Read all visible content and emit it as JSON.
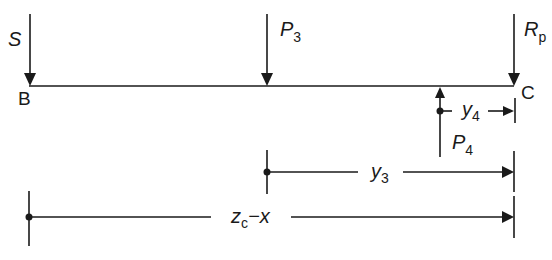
{
  "diagram": {
    "type": "beam-force-diagram",
    "stroke_color": "#1a1a1a",
    "background": "#ffffff",
    "nodes": [
      {
        "id": "B",
        "label": "B"
      },
      {
        "id": "C",
        "label": "C"
      }
    ],
    "forces": [
      {
        "id": "S",
        "label": "S",
        "subscript": "",
        "direction": "down",
        "at": "B"
      },
      {
        "id": "P3",
        "label": "P",
        "subscript": "3",
        "direction": "down",
        "at": "middle"
      },
      {
        "id": "Rp",
        "label": "R",
        "subscript": "p",
        "direction": "down",
        "at": "C"
      },
      {
        "id": "P4",
        "label": "P",
        "subscript": "4",
        "direction": "up",
        "at": "near-C"
      }
    ],
    "dimensions": [
      {
        "id": "y4",
        "label": "y",
        "subscript": "4",
        "from": "P4",
        "to": "C"
      },
      {
        "id": "y3",
        "label": "y",
        "subscript": "3",
        "from": "P3",
        "to": "C"
      },
      {
        "id": "zc-x",
        "label_main": "z",
        "subscript": "c",
        "suffix": "−x",
        "from": "B",
        "to": "C"
      }
    ]
  }
}
